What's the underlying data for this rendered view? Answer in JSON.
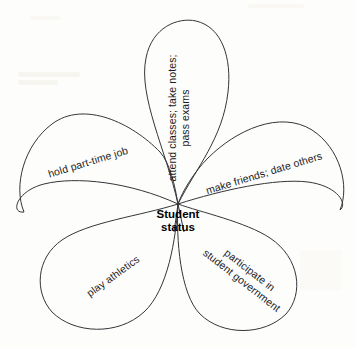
{
  "diagram": {
    "type": "petal-diagram",
    "center": {
      "line1": "Student",
      "line2": "status"
    },
    "petals": [
      {
        "id": "attend-classes",
        "position": "top",
        "line1": "attend classes; take notes;",
        "line2": "pass exams",
        "rotation_deg": -90
      },
      {
        "id": "part-time-job",
        "position": "upper-left",
        "line1": "hold part-time job",
        "line2": "",
        "rotation_deg": -17
      },
      {
        "id": "make-friends",
        "position": "upper-right",
        "line1": "make friends; date others",
        "line2": "",
        "rotation_deg": -17
      },
      {
        "id": "play-athletics",
        "position": "lower-left",
        "line1": "play athletics",
        "line2": "",
        "rotation_deg": -36
      },
      {
        "id": "student-government",
        "position": "lower-right",
        "line1": "participate in",
        "line2": "student government",
        "rotation_deg": 38
      }
    ],
    "colors": {
      "stroke": "#35353a",
      "text": "#1b1b1e",
      "background": "#fdfdfb"
    }
  }
}
